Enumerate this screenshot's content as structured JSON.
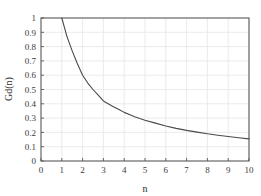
{
  "chart_data": {
    "type": "line",
    "title": "",
    "subtitle": "",
    "xlabel": "n",
    "ylabel": "Gd(n)",
    "xlim": [
      0,
      10
    ],
    "ylim": [
      0,
      1
    ],
    "grid": true,
    "legend": null,
    "x_ticks": [
      "0",
      "1",
      "2",
      "3",
      "4",
      "5",
      "6",
      "7",
      "8",
      "9",
      "10"
    ],
    "y_ticks": [
      "0",
      "0.1",
      "0.2",
      "0.3",
      "0.4",
      "0.5",
      "0.6",
      "0.7",
      "0.8",
      "0.9",
      "1"
    ],
    "series": [
      {
        "name": "Gd(n)",
        "color": "#4a4a4a",
        "x": [
          1,
          1.25,
          1.5,
          1.75,
          2,
          2.25,
          2.5,
          2.75,
          3,
          3.25,
          3.5,
          3.75,
          4,
          4.25,
          4.5,
          4.75,
          5,
          5.5,
          6,
          6.5,
          7,
          7.5,
          8,
          8.5,
          9,
          9.5,
          10
        ],
        "values": [
          1.0,
          0.87,
          0.77,
          0.68,
          0.6,
          0.545,
          0.5,
          0.46,
          0.42,
          0.398,
          0.378,
          0.36,
          0.34,
          0.325,
          0.31,
          0.297,
          0.285,
          0.265,
          0.245,
          0.228,
          0.214,
          0.202,
          0.19,
          0.18,
          0.171,
          0.163,
          0.155
        ]
      }
    ],
    "annotations": []
  },
  "axes": {
    "x_axis_name": "n",
    "y_axis_name": "Gd(n)"
  },
  "style": {
    "grid_color": "#e9e9e9",
    "frame_color": "#585858",
    "line_color": "#4a4a4a",
    "background": "#ffffff",
    "tick_text_color": "#3a3a3a"
  }
}
